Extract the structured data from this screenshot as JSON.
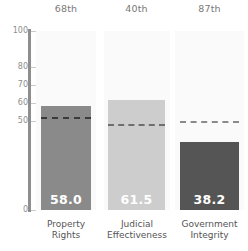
{
  "chart_data": {
    "type": "bar",
    "title": "",
    "subtitle": "",
    "xlabel": "",
    "ylabel": "",
    "ylim": [
      0,
      100
    ],
    "grid": false,
    "legend_position": "none",
    "categories": [
      "Property\nRights",
      "Judicial\nEffectiveness",
      "Government\nIntegrity"
    ],
    "values": [
      58.0,
      61.5,
      38.2
    ],
    "value_labels": [
      "58.0",
      "61.5",
      "38.2"
    ],
    "percentile_labels": [
      "68th",
      "40th",
      "87th"
    ],
    "reference_lines": [
      52.0,
      48.0,
      50.0
    ],
    "bar_colors": [
      "#8a8a8a",
      "#cdcdcd",
      "#555555"
    ],
    "reference_line_colors": [
      "#3a3a3a",
      "#6e6e6e",
      "#8a8a8a"
    ],
    "value_label_colors": [
      "#ffffff",
      "#ffffff",
      "#ffffff"
    ],
    "y_ticks": [
      {
        "value": 100,
        "label": "100"
      },
      {
        "value": 80,
        "label": "80"
      },
      {
        "value": 70,
        "label": "70"
      },
      {
        "value": 60,
        "label": "60"
      },
      {
        "value": 50,
        "label": "50"
      },
      {
        "value": 0,
        "label": "0"
      }
    ],
    "axis_color": "#8e8e8e",
    "column_background": "#fafafa",
    "plot_background": "#ffffff"
  }
}
